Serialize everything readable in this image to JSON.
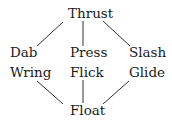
{
  "diagram": {
    "nodes": [
      {
        "id": "thrust",
        "label": "Thrust"
      },
      {
        "id": "dab",
        "label": "Dab"
      },
      {
        "id": "press",
        "label": "Press"
      },
      {
        "id": "slash",
        "label": "Slash"
      },
      {
        "id": "wring",
        "label": "Wring"
      },
      {
        "id": "flick",
        "label": "Flick"
      },
      {
        "id": "glide",
        "label": "Glide"
      },
      {
        "id": "float",
        "label": "Float"
      }
    ],
    "edges": [
      {
        "from": "thrust",
        "to": "dab"
      },
      {
        "from": "thrust",
        "to": "press"
      },
      {
        "from": "thrust",
        "to": "slash"
      },
      {
        "from": "wring",
        "to": "float"
      },
      {
        "from": "flick",
        "to": "float"
      },
      {
        "from": "glide",
        "to": "float"
      }
    ]
  }
}
